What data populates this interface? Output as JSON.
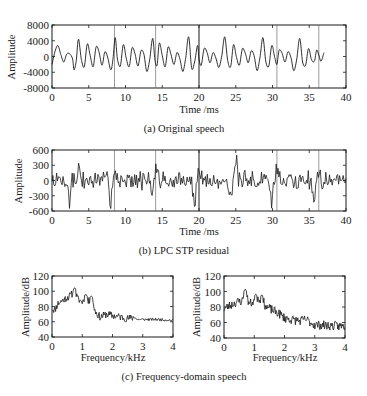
{
  "figure": {
    "background": "#ffffff",
    "line_color": "#1a1a1a",
    "marker_color": "#555555"
  },
  "chart_data": [
    {
      "id": "a",
      "type": "line",
      "caption": "(a) Original speech",
      "title": "",
      "xlabel": "Time /ms",
      "ylabel": "Amplitude",
      "xlim": [
        0,
        40
      ],
      "ylim": [
        -8000,
        8000
      ],
      "xticks": [
        0,
        5,
        10,
        15,
        20,
        25,
        30,
        35,
        40
      ],
      "yticks": [
        8000,
        4000,
        0,
        -4000,
        -8000
      ],
      "ytick_labels": [
        "8000",
        "4000",
        "0",
        "-4000",
        "-8000"
      ],
      "grid": false,
      "pitch_markers_ms": [
        8.5,
        14.1,
        20.0,
        30.6,
        36.3
      ],
      "frame": {
        "x": 52,
        "y": 25,
        "w": 294,
        "h": 63
      },
      "series": [
        {
          "name": "speech",
          "x": [
            0,
            0.4,
            0.8,
            1.2,
            1.6,
            2.0,
            2.4,
            2.8,
            3.0,
            3.3,
            3.6,
            4.0,
            4.4,
            4.8,
            5.2,
            5.6,
            6.0,
            6.4,
            6.8,
            7.2,
            7.6,
            8.0,
            8.3,
            8.6,
            8.9,
            9.3,
            9.7,
            10.1,
            10.5,
            10.9,
            11.3,
            11.7,
            12.1,
            12.5,
            12.9,
            13.3,
            13.7,
            14.0,
            14.3,
            14.6,
            15.0,
            15.4,
            15.8,
            16.2,
            16.6,
            17.0,
            17.4,
            17.8,
            18.2,
            18.6,
            19.0,
            19.4,
            19.8,
            20.0,
            20.3,
            20.7,
            21.1,
            21.5,
            21.9,
            22.3,
            22.7,
            23.1,
            23.5,
            23.9,
            24.3,
            24.7,
            25.1,
            25.5,
            25.9,
            26.3,
            26.7,
            27.1,
            27.5,
            27.9,
            28.3,
            28.7,
            29.1,
            29.5,
            29.9,
            30.3,
            30.6,
            30.9,
            31.3,
            31.7,
            32.1,
            32.5,
            32.9,
            33.3,
            33.7,
            34.1,
            34.5,
            34.9,
            35.3,
            35.7,
            36.0,
            36.3,
            36.6,
            37.0,
            37.4,
            37.8,
            38.2,
            38.6,
            39.0,
            39.4,
            39.8,
            40.0
          ],
          "y": [
            -2000,
            1200,
            2800,
            500,
            -1400,
            600,
            700,
            -600,
            -3400,
            -1000,
            4400,
            -800,
            -2600,
            3200,
            200,
            -2600,
            2400,
            1200,
            -2200,
            1200,
            -400,
            -3400,
            -600,
            4800,
            -600,
            -2400,
            3000,
            -400,
            -2600,
            2200,
            600,
            -2400,
            1400,
            600,
            -3800,
            -600,
            4600,
            -800,
            -2200,
            3400,
            200,
            -2600,
            2400,
            400,
            -2000,
            1000,
            -600,
            -3800,
            -200,
            5000,
            -3000,
            -1400,
            2800,
            -600,
            -2200,
            2000,
            1000,
            -1600,
            1000,
            -400,
            -2800,
            200,
            5000,
            -1000,
            -2600,
            3000,
            -200,
            -2200,
            2000,
            800,
            -1600,
            1400,
            200,
            -3600,
            -200,
            4800,
            -1400,
            -2400,
            2800,
            -200,
            -2000,
            1600,
            800,
            -1400,
            1200,
            -200,
            -3600,
            -600,
            4600,
            -1400,
            -2200,
            2000,
            -800,
            -1200,
            1600,
            400,
            -1200,
            1000
          ]
        }
      ]
    },
    {
      "id": "b",
      "type": "line",
      "caption": "(b) LPC STP residual",
      "title": "",
      "xlabel": "Time /ms",
      "ylabel": "Amplitude",
      "xlim": [
        0,
        40
      ],
      "ylim": [
        -600,
        600
      ],
      "xticks": [
        0,
        5,
        10,
        15,
        20,
        25,
        30,
        35,
        40
      ],
      "yticks": [
        600,
        300,
        0,
        -300,
        -600
      ],
      "ytick_labels": [
        "600",
        "300",
        "0",
        "-300",
        "-600"
      ],
      "grid": false,
      "pitch_markers_ms": [
        8.5,
        14.1,
        20.0,
        30.6,
        36.3
      ],
      "frame": {
        "x": 52,
        "y": 150,
        "w": 294,
        "h": 61
      },
      "series": [
        {
          "name": "residual",
          "seed": 7,
          "n_points": 320,
          "noise_amplitude": 150,
          "spikes": [
            {
              "x": 2.4,
              "y": -600
            },
            {
              "x": 3.6,
              "y": 320
            },
            {
              "x": 8.0,
              "y": -480
            },
            {
              "x": 8.6,
              "y": 300
            },
            {
              "x": 13.6,
              "y": -500
            },
            {
              "x": 14.2,
              "y": 330
            },
            {
              "x": 19.4,
              "y": -560
            },
            {
              "x": 20.0,
              "y": 320
            },
            {
              "x": 24.4,
              "y": -520
            },
            {
              "x": 25.1,
              "y": 380
            },
            {
              "x": 29.9,
              "y": -530
            },
            {
              "x": 30.6,
              "y": 350
            },
            {
              "x": 35.6,
              "y": -480
            },
            {
              "x": 36.3,
              "y": 360
            }
          ]
        }
      ]
    },
    {
      "id": "c1",
      "type": "line",
      "caption": "(c) Frequency-domain speech",
      "title": "",
      "xlabel": "Frequency/kHz",
      "ylabel": "Amplitude/dB",
      "xlim": [
        0,
        4
      ],
      "ylim": [
        40,
        120
      ],
      "xticks": [
        0,
        1,
        2,
        3,
        4
      ],
      "yticks": [
        120,
        100,
        80,
        60,
        40
      ],
      "grid": false,
      "frame": {
        "x": 52,
        "y": 276,
        "w": 121,
        "h": 61
      },
      "series": [
        {
          "name": "spectrum-left",
          "envelope_x": [
            0,
            0.1,
            0.2,
            0.35,
            0.5,
            0.6,
            0.75,
            0.85,
            1.0,
            1.1,
            1.2,
            1.3,
            1.45,
            1.6,
            1.8,
            2.0,
            2.3,
            2.5,
            2.75,
            2.8,
            3.0,
            3.5,
            4.0
          ],
          "envelope_y": [
            77,
            76,
            84,
            88,
            92,
            94,
            100,
            90,
            86,
            94,
            86,
            90,
            72,
            66,
            70,
            68,
            66,
            64,
            66,
            63,
            63,
            63,
            62
          ],
          "peaks": [
            {
              "x": 0.75,
              "y": 105
            },
            {
              "x": 1.12,
              "y": 96
            },
            {
              "x": 1.3,
              "y": 94
            }
          ],
          "seed": 11,
          "jitter_db": 5
        }
      ]
    },
    {
      "id": "c2",
      "type": "line",
      "caption": "(c) Frequency-domain speech",
      "title": "",
      "xlabel": "Frequency/kHz",
      "ylabel": "Amplitude/dB",
      "xlim": [
        0,
        4
      ],
      "ylim": [
        40,
        120
      ],
      "xticks": [
        0,
        1,
        2,
        3,
        4
      ],
      "yticks": [
        120,
        100,
        80,
        60,
        40
      ],
      "grid": false,
      "frame": {
        "x": 224,
        "y": 276,
        "w": 121,
        "h": 62
      },
      "series": [
        {
          "name": "spectrum-right",
          "envelope_x": [
            0,
            0.2,
            0.4,
            0.6,
            0.7,
            0.85,
            1.0,
            1.1,
            1.25,
            1.4,
            1.6,
            1.8,
            2.0,
            2.2,
            2.5,
            2.7,
            3.0,
            3.5,
            4.0
          ],
          "envelope_y": [
            78,
            82,
            86,
            88,
            96,
            84,
            88,
            92,
            90,
            80,
            76,
            72,
            66,
            64,
            62,
            64,
            57,
            56,
            55
          ],
          "peaks": [
            {
              "x": 0.7,
              "y": 103
            },
            {
              "x": 1.05,
              "y": 97
            },
            {
              "x": 1.25,
              "y": 96
            }
          ],
          "seed": 23,
          "jitter_db": 6
        }
      ]
    }
  ],
  "captions": {
    "a": "(a) Original speech",
    "b": "(b) LPC STP residual",
    "c": "(c) Frequency-domain speech"
  }
}
